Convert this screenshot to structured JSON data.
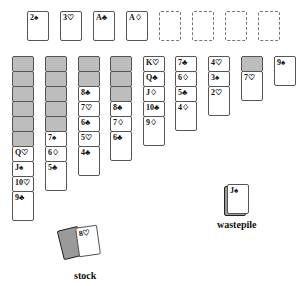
{
  "foundations": [
    {
      "label": "2♠"
    },
    {
      "label": "3♡"
    },
    {
      "label": "A♣"
    },
    {
      "label": "A♢"
    }
  ],
  "empty_slots": 4,
  "tableau": [
    {
      "down": 6,
      "up": [
        "Q♡",
        "J♠",
        "10♡",
        "9♣"
      ]
    },
    {
      "down": 5,
      "up": [
        "7♠",
        "6♢",
        "5♣"
      ]
    },
    {
      "down": 2,
      "up": [
        "8♣",
        "7♡",
        "6♣",
        "5♡",
        "4♣"
      ]
    },
    {
      "down": 3,
      "up": [
        "8♣",
        "7♢",
        "6♣"
      ]
    },
    {
      "down": 0,
      "up": [
        "K♡",
        "Q♣",
        "J♢",
        "10♣",
        "9♢"
      ]
    },
    {
      "down": 0,
      "up": [
        "7♣",
        "6♢",
        "5♣",
        "4♢"
      ]
    },
    {
      "down": 0,
      "up": [
        "4♡",
        "3♠",
        "2♡"
      ]
    },
    {
      "down": 1,
      "up": [
        "7♡"
      ]
    },
    {
      "down": 0,
      "up": [
        "9♠"
      ]
    }
  ],
  "wastepile": {
    "top": "J♠",
    "label": "wastepile"
  },
  "stock": {
    "top": "8♡",
    "label": "stock"
  }
}
